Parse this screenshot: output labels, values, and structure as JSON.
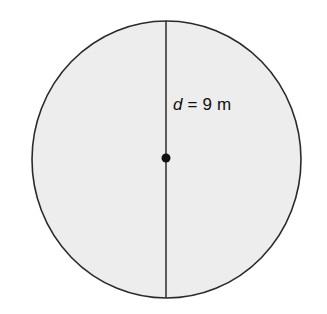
{
  "diagram": {
    "type": "circle-diameter",
    "label": {
      "variable": "d",
      "equals": "=",
      "value": "9",
      "unit": "m"
    },
    "colors": {
      "fill": "#ededed",
      "stroke": "#2a2a2a",
      "center_point": "#111111"
    }
  }
}
